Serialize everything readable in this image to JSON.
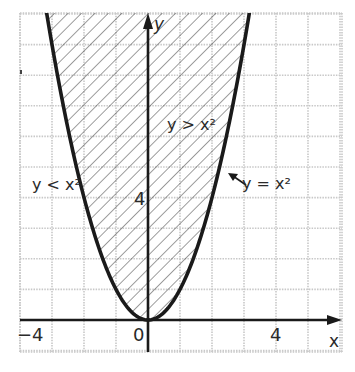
{
  "figure": {
    "type": "inequality-graph",
    "labels": {
      "y_axis": "y",
      "x_axis": "x",
      "region_above": "y > x²",
      "region_below": "y < x²",
      "curve": "y = x²",
      "tick_x_neg4": "−4",
      "tick_x_0": "0",
      "tick_x_4": "4",
      "tick_y_4": "4"
    },
    "curve_equation": "y = x^2",
    "shaded_region": "y > x^2",
    "x_range": [
      -4,
      6
    ],
    "y_range": [
      -1,
      10
    ],
    "grid_step": 1,
    "colors": {
      "curve": "#1a1a1a",
      "axis": "#1a1a1a",
      "grid": "#c8c8c8",
      "hatch": "#3a3a3a",
      "text": "#2a2a2a"
    }
  },
  "chart_data": {
    "type": "line",
    "title": "",
    "xlabel": "x",
    "ylabel": "y",
    "series": [
      {
        "name": "y = x²",
        "x": [
          -3,
          -2.5,
          -2,
          -1.5,
          -1,
          -0.5,
          0,
          0.5,
          1,
          1.5,
          2,
          2.5,
          3
        ],
        "y": [
          9,
          6.25,
          4,
          2.25,
          1,
          0.25,
          0,
          0.25,
          1,
          2.25,
          4,
          6.25,
          9
        ]
      }
    ],
    "shaded_region": "y > x² (hatched)",
    "annotations": [
      "y > x²",
      "y < x²",
      "y = x²"
    ],
    "x_tick_labels": [
      "−4",
      "0",
      "4"
    ],
    "y_tick_labels": [
      "4"
    ],
    "xlim": [
      -4,
      6
    ],
    "ylim": [
      -1,
      10
    ],
    "grid": true
  }
}
